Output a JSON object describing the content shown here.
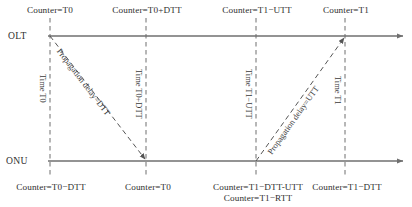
{
  "diagram": {
    "type": "timing-sequence",
    "canvas": {
      "width": 412,
      "height": 207
    },
    "colors": {
      "line": "#6f6f6f",
      "dashed": "#6f6f6f",
      "text": "#2f2f2f",
      "background": "#ffffff"
    },
    "axes": [
      {
        "name": "OLT",
        "label": "OLT",
        "y": 36,
        "x_start": 48,
        "x_end": 405,
        "arrow": "right"
      },
      {
        "name": "ONU",
        "label": "ONU",
        "y": 161,
        "x_start": 48,
        "x_end": 405,
        "arrow": "right"
      }
    ],
    "event_lines": [
      {
        "id": "e0",
        "x": 50,
        "y_top": 18,
        "y_bottom": 178,
        "top_label": "Counter=T0",
        "bottom_label": "Counter=T0−DTT",
        "time_label": "Time T0"
      },
      {
        "id": "e1",
        "x": 146,
        "y_top": 18,
        "y_bottom": 178,
        "top_label": "Counter=T0+DTT",
        "bottom_label": "Counter=T0",
        "time_label": "Time T0+DTT"
      },
      {
        "id": "e2",
        "x": 256,
        "y_top": 18,
        "y_bottom": 178,
        "top_label": "Counter=T1−UTT",
        "bottom_label": "Counter=T1−DTT-UTT",
        "bottom_label2": "Counter=T1−RTT",
        "time_label": "Time T1−UTT"
      },
      {
        "id": "e3",
        "x": 345,
        "y_top": 18,
        "y_bottom": 178,
        "top_label": "Counter=T1",
        "bottom_label": "Counter=T1−DTT",
        "time_label": "Time T1"
      }
    ],
    "transmissions": [
      {
        "id": "downstream",
        "label": "Propagation delay=DTT",
        "from": {
          "x": 50,
          "y": 36,
          "node": "OLT"
        },
        "to": {
          "x": 146,
          "y": 161,
          "node": "ONU"
        },
        "direction": "OLT-to-ONU",
        "style": "dashed-arrow"
      },
      {
        "id": "upstream",
        "label": "Propagation delay=UTT",
        "from": {
          "x": 256,
          "y": 161,
          "node": "ONU"
        },
        "to": {
          "x": 345,
          "y": 36,
          "node": "OLT"
        },
        "direction": "ONU-to-OLT",
        "style": "dashed-arrow"
      }
    ],
    "top_labels_y": 6,
    "bottom_labels_y": 182,
    "bottom_labels_y2": 193
  }
}
